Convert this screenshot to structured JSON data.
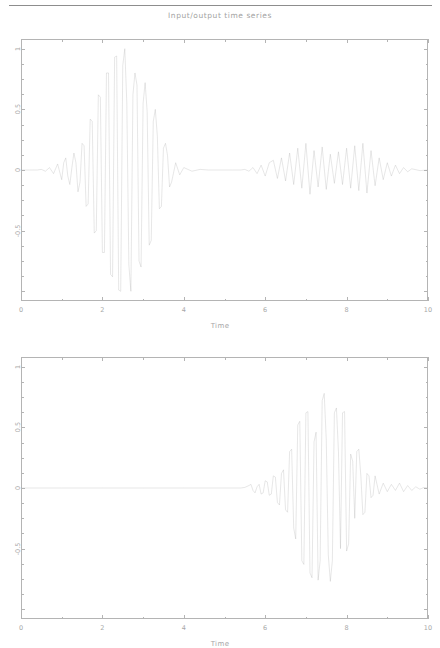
{
  "figure": {
    "title": "Input/output time series",
    "line_color": "#9e9e9e",
    "axis_color": "#b4b4b4",
    "text_color": "#a2a2a2",
    "background": "#ffffff"
  },
  "chart_data": [
    {
      "type": "line",
      "id": "input-signal",
      "title": "Input/output time series",
      "xlabel": "Time",
      "ylabel": "",
      "xlim": [
        0,
        10
      ],
      "ylim": [
        -1.08,
        1.08
      ],
      "xticks": [
        0,
        2,
        4,
        6,
        8,
        10
      ],
      "xticklabels": [
        "0",
        "2",
        "4",
        "6",
        "8",
        "10"
      ],
      "xticks_minor": [
        1,
        3,
        5,
        7,
        9
      ],
      "yticks": [
        -1,
        -0.5,
        0,
        0.5,
        1
      ],
      "yticklabels": [
        "",
        "-0.5",
        "0",
        "0.5",
        "1"
      ],
      "yticks_minor": [
        -0.875,
        -0.75,
        -0.625,
        -0.375,
        -0.25,
        -0.125,
        0.125,
        0.25,
        0.375,
        0.625,
        0.75,
        0.875
      ],
      "grid": false,
      "legend": null,
      "series": [
        {
          "name": "input",
          "description": "Modulated wavelet burst peaking near t=2.55 plus a low-amplitude noisy response from t=5.5 to t=9.5",
          "x": [
            0.0,
            0.1,
            0.2,
            0.3,
            0.4,
            0.5,
            0.6,
            0.7,
            0.8,
            0.9,
            1.0,
            1.05,
            1.1,
            1.15,
            1.2,
            1.25,
            1.3,
            1.35,
            1.4,
            1.45,
            1.5,
            1.55,
            1.6,
            1.65,
            1.7,
            1.75,
            1.8,
            1.85,
            1.9,
            1.95,
            2.0,
            2.05,
            2.1,
            2.15,
            2.2,
            2.25,
            2.3,
            2.35,
            2.4,
            2.45,
            2.5,
            2.55,
            2.6,
            2.65,
            2.7,
            2.75,
            2.8,
            2.85,
            2.9,
            2.95,
            3.0,
            3.05,
            3.1,
            3.15,
            3.2,
            3.25,
            3.3,
            3.35,
            3.4,
            3.45,
            3.5,
            3.55,
            3.6,
            3.65,
            3.7,
            3.8,
            3.9,
            4.0,
            4.2,
            4.4,
            4.6,
            4.8,
            5.0,
            5.2,
            5.4,
            5.5,
            5.6,
            5.7,
            5.8,
            5.9,
            6.0,
            6.1,
            6.2,
            6.3,
            6.4,
            6.5,
            6.6,
            6.7,
            6.8,
            6.9,
            7.0,
            7.1,
            7.2,
            7.3,
            7.4,
            7.5,
            7.6,
            7.7,
            7.8,
            7.9,
            8.0,
            8.1,
            8.2,
            8.3,
            8.4,
            8.5,
            8.6,
            8.7,
            8.8,
            8.9,
            9.0,
            9.1,
            9.2,
            9.3,
            9.4,
            9.5,
            9.6,
            9.8,
            10.0
          ],
          "y": [
            0.0,
            0.0,
            0.0,
            0.0,
            0.0,
            0.005,
            -0.01,
            0.02,
            -0.03,
            0.05,
            -0.08,
            0.06,
            0.1,
            -0.05,
            -0.12,
            0.02,
            0.14,
            0.06,
            -0.18,
            -0.1,
            0.22,
            0.2,
            -0.3,
            -0.28,
            0.42,
            0.4,
            -0.52,
            -0.5,
            0.62,
            0.6,
            -0.68,
            -0.68,
            0.8,
            0.8,
            -0.86,
            -0.88,
            0.93,
            0.94,
            -0.99,
            -1.0,
            0.86,
            1.0,
            0.55,
            -0.78,
            -1.0,
            0.62,
            0.8,
            0.7,
            -0.75,
            -0.8,
            0.55,
            0.72,
            0.48,
            -0.62,
            -0.58,
            0.4,
            0.5,
            0.28,
            -0.32,
            -0.3,
            0.18,
            0.22,
            0.12,
            -0.14,
            -0.1,
            0.06,
            -0.04,
            0.02,
            -0.01,
            0.005,
            0.0,
            0.0,
            0.0,
            0.0,
            0.0,
            0.005,
            -0.01,
            0.02,
            -0.03,
            0.04,
            -0.05,
            0.06,
            0.08,
            -0.07,
            0.1,
            -0.09,
            0.14,
            -0.12,
            0.18,
            -0.15,
            0.22,
            -0.2,
            0.16,
            -0.14,
            0.19,
            -0.16,
            0.13,
            -0.11,
            0.15,
            -0.12,
            0.18,
            -0.15,
            0.2,
            -0.17,
            0.22,
            -0.19,
            0.16,
            -0.13,
            0.1,
            -0.08,
            0.06,
            -0.05,
            0.04,
            -0.03,
            0.02,
            -0.015,
            0.01,
            -0.005,
            0.0,
            0.0
          ]
        }
      ]
    },
    {
      "type": "line",
      "id": "output-signal",
      "title": "",
      "xlabel": "Time",
      "ylabel": "",
      "xlim": [
        0,
        10
      ],
      "ylim": [
        -1.08,
        1.08
      ],
      "xticks": [
        0,
        2,
        4,
        6,
        8,
        10
      ],
      "xticklabels": [
        "0",
        "2",
        "4",
        "6",
        "8",
        "10"
      ],
      "xticks_minor": [
        1,
        3,
        5,
        7,
        9
      ],
      "yticks": [
        -1,
        -0.5,
        0,
        0.5,
        1
      ],
      "yticklabels": [
        "",
        "-0.5",
        "0",
        "0.5",
        "1"
      ],
      "yticks_minor": [
        -0.875,
        -0.75,
        -0.625,
        -0.375,
        -0.25,
        -0.125,
        0.125,
        0.25,
        0.375,
        0.625,
        0.75,
        0.875
      ],
      "grid": false,
      "legend": null,
      "series": [
        {
          "name": "output",
          "description": "Zero until t=5.5, then a delayed modulated wavelet burst peaking near t=7.45 with maximum amplitude about 0.78",
          "x": [
            0.0,
            1.0,
            2.0,
            3.0,
            4.0,
            5.0,
            5.4,
            5.5,
            5.6,
            5.65,
            5.7,
            5.75,
            5.8,
            5.85,
            5.9,
            5.95,
            6.0,
            6.05,
            6.1,
            6.15,
            6.2,
            6.25,
            6.3,
            6.35,
            6.4,
            6.45,
            6.5,
            6.55,
            6.6,
            6.65,
            6.7,
            6.75,
            6.8,
            6.85,
            6.9,
            6.95,
            7.0,
            7.05,
            7.1,
            7.15,
            7.2,
            7.25,
            7.3,
            7.35,
            7.4,
            7.45,
            7.5,
            7.55,
            7.6,
            7.65,
            7.7,
            7.75,
            7.8,
            7.85,
            7.9,
            7.95,
            8.0,
            8.05,
            8.1,
            8.15,
            8.2,
            8.25,
            8.3,
            8.35,
            8.4,
            8.45,
            8.5,
            8.55,
            8.6,
            8.65,
            8.7,
            8.8,
            8.9,
            9.0,
            9.1,
            9.2,
            9.3,
            9.4,
            9.5,
            9.6,
            9.7,
            9.8,
            9.9,
            10.0
          ],
          "y": [
            0.0,
            0.0,
            0.0,
            0.0,
            0.0,
            0.0,
            0.0,
            0.005,
            0.02,
            0.03,
            -0.02,
            -0.04,
            0.01,
            0.03,
            -0.05,
            -0.04,
            0.06,
            0.05,
            -0.06,
            -0.05,
            0.1,
            0.09,
            -0.12,
            -0.14,
            0.12,
            0.15,
            -0.18,
            -0.2,
            0.3,
            0.32,
            -0.33,
            -0.42,
            0.52,
            0.55,
            -0.6,
            -0.63,
            0.62,
            0.63,
            -0.7,
            -0.74,
            0.38,
            0.46,
            -0.76,
            -0.6,
            0.72,
            0.78,
            0.4,
            -0.55,
            -0.77,
            -0.6,
            0.62,
            0.66,
            0.3,
            -0.5,
            0.62,
            0.63,
            -0.52,
            -0.46,
            0.28,
            0.22,
            -0.25,
            0.3,
            0.32,
            0.1,
            -0.22,
            -0.2,
            0.12,
            0.1,
            -0.08,
            -0.06,
            0.1,
            -0.05,
            0.04,
            -0.03,
            0.03,
            -0.02,
            0.04,
            -0.03,
            0.02,
            -0.02,
            0.01,
            -0.01,
            0.005,
            0.0
          ]
        }
      ]
    }
  ],
  "panels": [
    {
      "name": "input-panel",
      "xlabel": "Time",
      "xticklabels": [
        "0",
        "2",
        "4",
        "6",
        "8",
        "10"
      ],
      "yticklabels": [
        "1",
        "0.5",
        "0",
        "-0.5"
      ]
    },
    {
      "name": "output-panel",
      "xlabel": "Time",
      "xticklabels": [
        "0",
        "2",
        "4",
        "6",
        "8",
        "10"
      ],
      "yticklabels": [
        "1",
        "0.5",
        "0",
        "-0.5"
      ]
    }
  ]
}
